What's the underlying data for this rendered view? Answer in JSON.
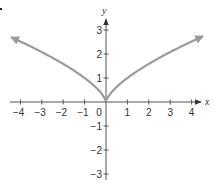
{
  "chart_data": {
    "type": "line",
    "title": "",
    "xlabel": "x",
    "ylabel": "y",
    "xlim": [
      -4.4,
      4.5
    ],
    "ylim": [
      -3,
      3
    ],
    "xticks": [
      -4,
      -3,
      -2,
      -1,
      0,
      1,
      2,
      3,
      4
    ],
    "yticks": [
      -3,
      -2,
      -1,
      1,
      2,
      3
    ],
    "xtick_labels": [
      "−4",
      "−3",
      "−2",
      "−1",
      "0",
      "1",
      "2",
      "3",
      "4"
    ],
    "ytick_labels": [
      "−3",
      "−2",
      "−1",
      "1",
      "2",
      "3"
    ],
    "grid": false,
    "legend": null,
    "series": [
      {
        "name": "y = |x|^(2/3)",
        "color": "#9a9a9a",
        "arrows_at_ends": true,
        "x": [
          -4.4,
          -4,
          -3,
          -2,
          -1,
          -0.5,
          0,
          0.5,
          1,
          2,
          3,
          4,
          4.5
        ],
        "y": [
          2.69,
          2.52,
          2.08,
          1.59,
          1.0,
          0.63,
          0,
          0.63,
          1.0,
          1.59,
          2.08,
          2.52,
          2.73
        ]
      }
    ]
  },
  "colors": {
    "axis": "#555555",
    "curve": "#9a9a9a",
    "text": "#333333"
  }
}
